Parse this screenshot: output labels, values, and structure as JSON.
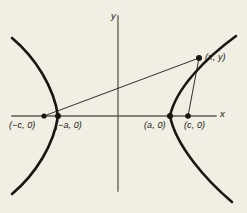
{
  "figure": {
    "kind": "hyperbola-focus-definition-diagram",
    "background_color": "#f1eee4",
    "ink_color": "#1a1713",
    "axis_color": "#5d584e",
    "axes": {
      "x_label": "x",
      "y_label": "y",
      "x_axis_from": [
        12,
        116
      ],
      "x_axis_to": [
        216,
        116
      ],
      "y_axis_from": [
        118,
        16
      ],
      "y_axis_to": [
        118,
        191
      ]
    },
    "points": [
      {
        "id": "left-focus",
        "label": "(−c, 0)",
        "cx": 44,
        "cy": 116,
        "r": 2.6
      },
      {
        "id": "left-vertex",
        "label": "(−a, 0)",
        "cx": 58,
        "cy": 116,
        "r": 3.0
      },
      {
        "id": "right-vertex",
        "label": "(a, 0)",
        "cx": 170,
        "cy": 116,
        "r": 3.0
      },
      {
        "id": "right-focus",
        "label": "(c, 0)",
        "cx": 188,
        "cy": 116,
        "r": 2.8
      },
      {
        "id": "curve-point",
        "label": "(x, y)",
        "cx": 199,
        "cy": 58,
        "r": 3.0
      }
    ],
    "segments": [
      {
        "id": "left-focus-to-point",
        "from": [
          44,
          116
        ],
        "to": [
          199,
          58
        ]
      },
      {
        "id": "right-focus-to-point",
        "from": [
          188,
          116
        ],
        "to": [
          199,
          58
        ]
      }
    ],
    "curves": {
      "left_branch": "M 12,38 C 36,58 54,88 58,116 C 54,144 36,174 12,194",
      "right_branch": "M 236,36 C 206,58 176,88 170,116 C 176,146 206,180 232,202"
    }
  }
}
